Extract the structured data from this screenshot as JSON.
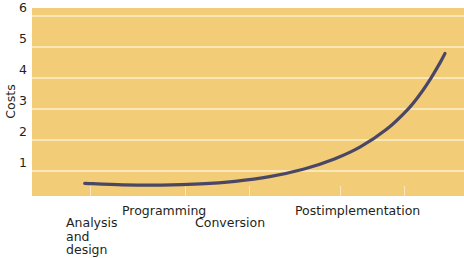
{
  "chart_data": {
    "type": "line",
    "title": "",
    "subtitle": "",
    "xlabel": "",
    "ylabel": "Costs",
    "ylim": [
      0,
      6.4
    ],
    "xlim": [
      0,
      10
    ],
    "grid": true,
    "grid_axis": "y",
    "legend": false,
    "legend_position": "none",
    "y_ticks": [
      6,
      5,
      4,
      3,
      2,
      1
    ],
    "y_tick_labels": [
      "6",
      "5",
      "4",
      "3",
      "2",
      "1"
    ],
    "categories": [
      "Analysis\nand\ndesign",
      "Programming",
      "Conversion",
      "Postimplementation"
    ],
    "x_tick_positions": [
      1.35,
      3.55,
      5.03,
      7.15,
      8.62
    ],
    "series": [
      {
        "name": "Cost of correcting an error",
        "color": "#4a4766",
        "points": [
          {
            "x": 1.22,
            "y": 0.43
          },
          {
            "x": 2.1,
            "y": 0.38
          },
          {
            "x": 3.0,
            "y": 0.37
          },
          {
            "x": 3.9,
            "y": 0.41
          },
          {
            "x": 4.7,
            "y": 0.5
          },
          {
            "x": 5.5,
            "y": 0.66
          },
          {
            "x": 6.3,
            "y": 0.92
          },
          {
            "x": 7.0,
            "y": 1.26
          },
          {
            "x": 7.6,
            "y": 1.67
          },
          {
            "x": 8.2,
            "y": 2.26
          },
          {
            "x": 8.7,
            "y": 2.95
          },
          {
            "x": 9.0,
            "y": 3.5
          },
          {
            "x": 9.25,
            "y": 4.05
          },
          {
            "x": 9.45,
            "y": 4.55
          },
          {
            "x": 9.56,
            "y": 4.85
          }
        ]
      }
    ],
    "annotations": []
  },
  "axis": {
    "y_title": "Costs",
    "y_ticks": [
      "6",
      "5",
      "4",
      "3",
      "2",
      "1"
    ],
    "x_categories": [
      {
        "id": "analysis-and-design",
        "label": "Analysis\nand\ndesign",
        "left": 66,
        "top": 216
      },
      {
        "id": "programming",
        "label": "Programming",
        "left": 122,
        "top": 204
      },
      {
        "id": "conversion",
        "label": "Conversion",
        "left": 195,
        "top": 216
      },
      {
        "id": "postimplementation",
        "label": "Postimplementation",
        "left": 295,
        "top": 204
      }
    ]
  },
  "colors": {
    "plot_background": "#f2cc77",
    "gridline": "#f9e6b9",
    "curve": "#4a4766",
    "text": "#231f20",
    "page_background": "#ffffff"
  }
}
